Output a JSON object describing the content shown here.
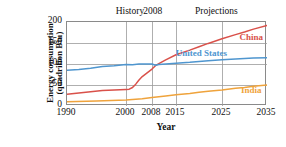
{
  "chart_data": {
    "type": "line",
    "title": "",
    "xlabel": "Year",
    "ylabel_line1": "Energy consumption",
    "ylabel_line2": "(quadrilion Btu)",
    "ylabel": "Energy consumption (quadrilion Btu)",
    "xlim": [
      1990,
      2035
    ],
    "ylim": [
      0,
      200
    ],
    "xticks": [
      1990,
      2000,
      2008,
      2015,
      2025,
      2035
    ],
    "xtick_labels": [
      "1990",
      "2000",
      "2008",
      "2015",
      "2025",
      "2035"
    ],
    "yticks": [
      0,
      50,
      100,
      150,
      200
    ],
    "ytick_labels": [
      "0",
      "50",
      "100",
      "150",
      "200"
    ],
    "grid": "both",
    "legend_position": "inline-right",
    "annotations": [
      {
        "text": "History",
        "x": 2001.5,
        "y": 215
      },
      {
        "text": "2008",
        "x": 2008.5,
        "y": 215
      },
      {
        "text": "Projections",
        "x": 2024.0,
        "y": 215
      }
    ],
    "series": [
      {
        "name": "China",
        "color": "#d9514a",
        "label_x": 2031.5,
        "label_y": 163,
        "x": [
          1990,
          1992,
          1994,
          1996,
          1998,
          2000,
          2001,
          2002,
          2003,
          2004,
          2005,
          2006,
          2007,
          2008,
          2009,
          2010,
          2012,
          2015,
          2018,
          2020,
          2022,
          2025,
          2028,
          2030,
          2032,
          2035
        ],
        "values": [
          28,
          31,
          34,
          37,
          38,
          39,
          40,
          44,
          52,
          62,
          70,
          76,
          82,
          88,
          96,
          101,
          110,
          122,
          133,
          141,
          149,
          160,
          170,
          176,
          183,
          192
        ]
      },
      {
        "name": "United States",
        "color": "#4f96cf",
        "label_x": 2020.5,
        "label_y": 123,
        "x": [
          1990,
          1992,
          1994,
          1996,
          1998,
          2000,
          2002,
          2004,
          2006,
          2008,
          2009,
          2010,
          2012,
          2015,
          2018,
          2020,
          2022,
          2025,
          2028,
          2030,
          2032,
          2035
        ],
        "values": [
          85,
          87,
          90,
          94,
          96,
          99,
          98,
          100,
          100,
          100,
          97,
          99,
          100,
          102,
          104,
          106,
          108,
          110,
          112,
          113,
          114,
          115
        ]
      },
      {
        "name": "India",
        "color": "#efa33c",
        "label_x": 2031.5,
        "label_y": 36,
        "x": [
          1990,
          1995,
          2000,
          2005,
          2008,
          2010,
          2012,
          2015,
          2018,
          2020,
          2022,
          2025,
          2028,
          2030,
          2032,
          2035
        ],
        "values": [
          10,
          12,
          14,
          17,
          20,
          22,
          24,
          27,
          30,
          33,
          35,
          38,
          42,
          44,
          47,
          50
        ]
      }
    ]
  }
}
